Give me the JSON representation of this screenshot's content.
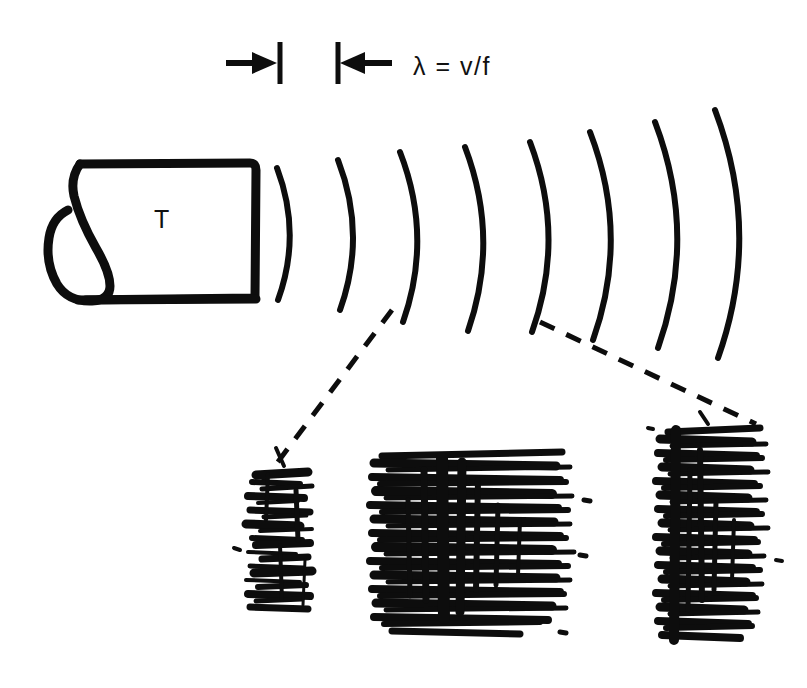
{
  "figure": {
    "background_color": "#ffffff",
    "ink_color": "#0d0d0d",
    "width": 807,
    "height": 688
  },
  "annotations": {
    "wavelength_label": "λ = v/f",
    "transducer_label": "T"
  },
  "dimension_marker": {
    "name": "wavelength-dimension",
    "left_tick_x": 279,
    "right_tick_x": 338,
    "tick_top_y": 42,
    "tick_bottom_y": 84,
    "arrow_y": 63,
    "left_arrow_direction": "right",
    "right_arrow_direction": "left",
    "label": "λ = v/f"
  },
  "transducer": {
    "name": "transducer-body",
    "label": "T",
    "box": {
      "x": 62,
      "y": 163,
      "width": 193,
      "height": 139
    },
    "cable_loop": "teardrop"
  },
  "wavefronts": {
    "count": 8,
    "description": "Concentric arcs of increasing radius emitted rightward from the transducer face",
    "arcs": [
      {
        "index": 1,
        "apex_x": 300,
        "top_y": 168,
        "bottom_y": 300,
        "bulge": 23
      },
      {
        "index": 2,
        "apex_x": 363,
        "top_y": 160,
        "bottom_y": 310,
        "bulge": 26
      },
      {
        "index": 3,
        "apex_x": 427,
        "top_y": 152,
        "bottom_y": 322,
        "bulge": 29
      },
      {
        "index": 4,
        "apex_x": 492,
        "top_y": 147,
        "bottom_y": 331,
        "bulge": 32
      },
      {
        "index": 5,
        "apex_x": 557,
        "top_y": 142,
        "bottom_y": 332,
        "bulge": 34
      },
      {
        "index": 6,
        "apex_x": 621,
        "top_y": 132,
        "bottom_y": 340,
        "bulge": 37
      },
      {
        "index": 7,
        "apex_x": 687,
        "top_y": 122,
        "bottom_y": 348,
        "bulge": 40
      },
      {
        "index": 8,
        "apex_x": 752,
        "top_y": 110,
        "bottom_y": 358,
        "bulge": 43
      }
    ]
  },
  "leader_lines": [
    {
      "name": "leader-line-left",
      "style": "dashed",
      "from": {
        "x": 392,
        "y": 310
      },
      "to": {
        "x": 262,
        "y": 483
      }
    },
    {
      "name": "leader-line-right",
      "style": "dashed",
      "from": {
        "x": 540,
        "y": 322
      },
      "to": {
        "x": 756,
        "y": 424
      }
    }
  ],
  "trace_blocks": [
    {
      "name": "trace-block-near",
      "position": "left",
      "x": 244,
      "y": 468,
      "width": 74,
      "height": 144,
      "line_count": 26,
      "density": "low"
    },
    {
      "name": "trace-block-focal",
      "position": "center",
      "x": 370,
      "y": 452,
      "width": 208,
      "height": 186,
      "line_count": 34,
      "density": "high"
    },
    {
      "name": "trace-block-far",
      "position": "right",
      "x": 654,
      "y": 424,
      "width": 130,
      "height": 218,
      "line_count": 38,
      "density": "medium"
    }
  ]
}
